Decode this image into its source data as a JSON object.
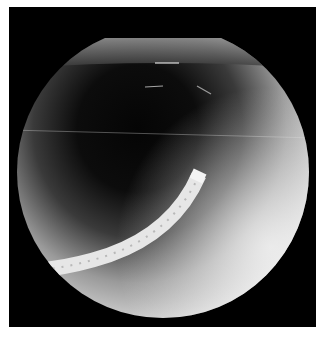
{
  "image": {
    "kind": "fluoroscopy",
    "description": "Circular fluoroscopic field on black square frame showing a curved, segmented bright endoscope entering from lower-left with its tip near the center; dark central region surrounded by bright periphery",
    "colors": {
      "frame": "#000000",
      "margin": "#ffffff",
      "field_bright": "#e8e8e8",
      "field_mid": "#8a8a8a",
      "field_dark": "#0a0a0a",
      "scope": "#f2f2f2"
    }
  }
}
